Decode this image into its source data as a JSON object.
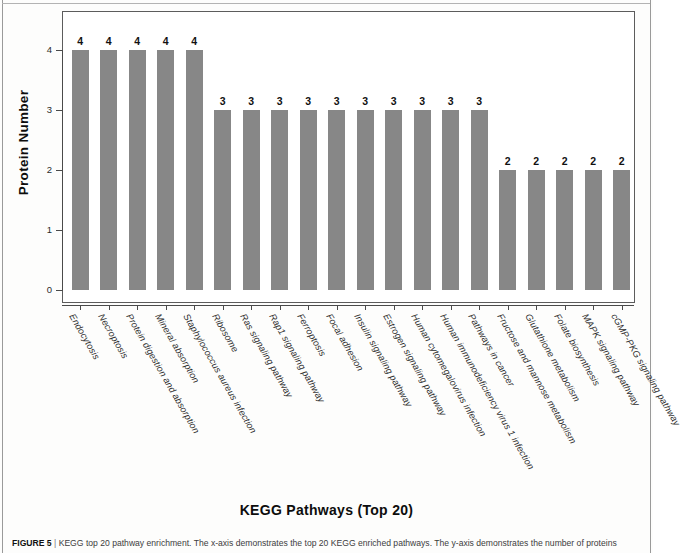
{
  "figure": {
    "caption_label": "FIGURE 5",
    "caption_separator": "|",
    "caption_text": "KEGG top 20 pathway enrichment. The x-axis demonstrates the top 20 KEGG enriched pathways. The y-axis demonstrates the number of proteins"
  },
  "chart_data": {
    "type": "bar",
    "title": "KEGG Pathways (Top 20)",
    "xlabel": "KEGG Pathways (Top 20)",
    "ylabel": "Protein Number",
    "ylim": [
      0,
      4.3
    ],
    "yticks": [
      "0",
      "1",
      "2",
      "3",
      "4"
    ],
    "grid": false,
    "legend": "none",
    "bar_color": "#878787",
    "categories": [
      "Endocytosis",
      "Necroptosis",
      "Protein digestion and absorption",
      "Mineral absorption",
      "Staphylococcus aureus infection",
      "Ribosome",
      "Ras signaling pathway",
      "Rap1 signaling pathway",
      "Ferroptosis",
      "Focal adhesion",
      "Insulin signaling pathway",
      "Estrogen signaling pathway",
      "Human cytomegalovirus infection",
      "Human immunodeficiency virus 1 infection",
      "Pathways in cancer",
      "Fructose and mannose metabolism",
      "Glutathione metabolism",
      "Folate biosynthesis",
      "MAPK signaling pathway",
      "cGMP-PKG signaling pathway"
    ],
    "values": [
      4,
      4,
      4,
      4,
      4,
      3,
      3,
      3,
      3,
      3,
      3,
      3,
      3,
      3,
      3,
      2,
      2,
      2,
      2,
      2
    ],
    "value_labels": [
      "4",
      "4",
      "4",
      "4",
      "4",
      "3",
      "3",
      "3",
      "3",
      "3",
      "3",
      "3",
      "3",
      "3",
      "3",
      "2",
      "2",
      "2",
      "2",
      "2"
    ]
  }
}
